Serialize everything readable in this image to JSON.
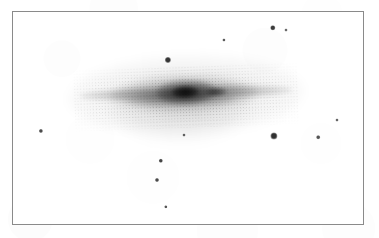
{
  "image": {
    "kind": "astronomical-plate-photograph",
    "subject": "edge-on spiral galaxy with foreground stars",
    "rendering": "grayscale negative (dark features on white sky)",
    "width": 379,
    "height": 238,
    "background_color": "#ffffff"
  },
  "frame": {
    "label": "plate border",
    "x": 12,
    "y": 11,
    "width": 352,
    "height": 214,
    "border_width": 1,
    "border_color": "#8a8a8a",
    "fill_color": "#ffffff"
  },
  "colors": {
    "sky": "#ffffff",
    "frame_line": "#8a8a8a",
    "galaxy_core": "#4a4a4a",
    "galaxy_disk": "#9a9a9a",
    "galaxy_halo": "#d8d8d8",
    "star_dark": "#3a3a3a",
    "star_mid": "#5a5a5a",
    "star_faint": "#7a7a7a"
  },
  "galaxy": {
    "name": "edge-on-spiral-galaxy",
    "center_x": 186,
    "center_y": 93,
    "position_angle_deg": -2,
    "components": [
      {
        "name": "outer-halo",
        "cx": 186,
        "cy": 95,
        "rx": 118,
        "ry": 40,
        "rot": -2,
        "peak_opacity": 0.115
      },
      {
        "name": "lower-halo-plume",
        "cx": 181,
        "cy": 109,
        "rx": 70,
        "ry": 34,
        "rot": -1,
        "peak_opacity": 0.1
      },
      {
        "name": "thin-disk",
        "cx": 186,
        "cy": 93,
        "rx": 106,
        "ry": 7.5,
        "rot": -1.6,
        "peak_opacity": 0.42
      },
      {
        "name": "thick-disk",
        "cx": 184,
        "cy": 94,
        "rx": 74,
        "ry": 16,
        "rot": -1.6,
        "peak_opacity": 0.3
      },
      {
        "name": "bulge",
        "cx": 186,
        "cy": 92,
        "rx": 30,
        "ry": 12,
        "rot": -2,
        "peak_opacity": 0.58
      },
      {
        "name": "nucleus",
        "cx": 185,
        "cy": 92,
        "rx": 13,
        "ry": 6,
        "rot": -2,
        "peak_opacity": 0.72
      },
      {
        "name": "knot-east",
        "cx": 216,
        "cy": 92,
        "rx": 11,
        "ry": 4.5,
        "rot": -2,
        "peak_opacity": 0.5
      },
      {
        "name": "dust-lane",
        "cx": 181,
        "cy": 100,
        "rx": 56,
        "ry": 5.5,
        "rot": -1,
        "peak_opacity": 0.26
      }
    ],
    "disk_extent": {
      "x_left": 82,
      "x_right": 292,
      "midplane_y": 93
    }
  },
  "stars": [
    {
      "id": "star-01",
      "label": "upper-right-bright",
      "x": 273,
      "y": 28,
      "radius": 2.7,
      "tone": "#3d3d3d"
    },
    {
      "id": "star-02",
      "label": "upper-right-faint",
      "x": 286,
      "y": 30,
      "radius": 1.5,
      "tone": "#6a6a6a"
    },
    {
      "id": "star-03",
      "label": "upper-centre-faint",
      "x": 224,
      "y": 40,
      "radius": 1.6,
      "tone": "#5c5c5c"
    },
    {
      "id": "star-04",
      "label": "above-nucleus",
      "x": 168,
      "y": 60,
      "radius": 3.1,
      "tone": "#363636"
    },
    {
      "id": "star-05",
      "label": "far-left",
      "x": 41,
      "y": 131,
      "radius": 2.1,
      "tone": "#4c4c4c"
    },
    {
      "id": "star-06",
      "label": "below-nucleus-faint",
      "x": 184,
      "y": 135,
      "radius": 1.5,
      "tone": "#606060"
    },
    {
      "id": "star-07",
      "label": "lower-right-bright",
      "x": 274,
      "y": 136,
      "radius": 3.6,
      "tone": "#303030"
    },
    {
      "id": "star-08",
      "label": "lower-right-faint",
      "x": 318,
      "y": 137,
      "radius": 1.8,
      "tone": "#545454"
    },
    {
      "id": "star-09",
      "label": "right-edge-faint",
      "x": 337,
      "y": 120,
      "radius": 1.5,
      "tone": "#656565"
    },
    {
      "id": "star-10",
      "label": "lower-centre-upper",
      "x": 161,
      "y": 161,
      "radius": 2.2,
      "tone": "#454545"
    },
    {
      "id": "star-11",
      "label": "lower-centre-lower",
      "x": 157,
      "y": 180,
      "radius": 2.0,
      "tone": "#4a4a4a"
    },
    {
      "id": "star-12",
      "label": "bottom-centre",
      "x": 166,
      "y": 207,
      "radius": 1.7,
      "tone": "#565656"
    }
  ]
}
